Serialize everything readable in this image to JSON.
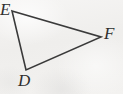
{
  "figure": {
    "kind": "geometry-diagram",
    "shape": "triangle",
    "name": "triangle-DEF",
    "background_color": "#f2f1ef",
    "stroke_color": "#3a3a3a",
    "stroke_width": 1.6,
    "label_color": "#2e2e2e",
    "width": 123,
    "height": 94
  },
  "vertices": [
    {
      "id": "E",
      "label": "E",
      "point": {
        "x": 12,
        "y": 11
      },
      "label_position": {
        "x": 0,
        "y": 1
      }
    },
    {
      "id": "F",
      "label": "F",
      "point": {
        "x": 101,
        "y": 37
      },
      "label_position": {
        "x": 104,
        "y": 25
      }
    },
    {
      "id": "D",
      "label": "D",
      "point": {
        "x": 26,
        "y": 70
      },
      "label_position": {
        "x": 18,
        "y": 72
      }
    }
  ],
  "edges": [
    {
      "id": "EF",
      "from": "E",
      "to": "F",
      "name": "side-e-f"
    },
    {
      "id": "FD",
      "from": "F",
      "to": "D",
      "name": "side-f-d"
    },
    {
      "id": "DE",
      "from": "D",
      "to": "E",
      "name": "side-d-e"
    }
  ],
  "polygon_points": "12,11 101,37 26,70"
}
